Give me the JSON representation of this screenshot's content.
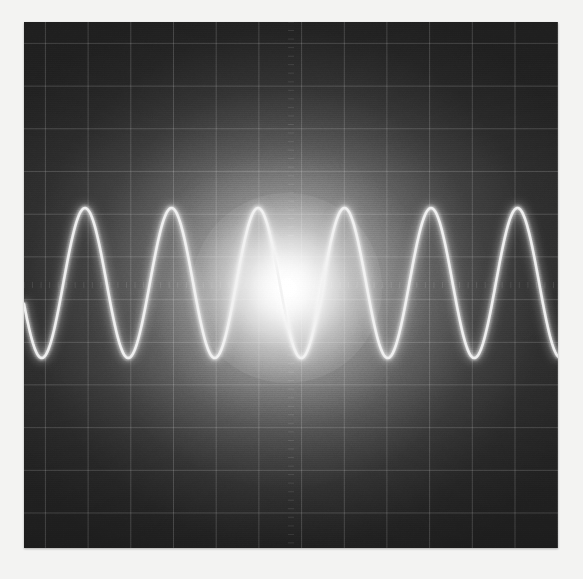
{
  "app": {
    "kind": "oscilloscope-waveform-display",
    "title": "Oscilloscope Waveform Display"
  },
  "canvas": {
    "width": 583,
    "height": 579,
    "bezel_color": "#f3f3f2"
  },
  "screen": {
    "x": 24,
    "y": 22,
    "width": 534,
    "height": 526,
    "background_color": "#2b2b2b",
    "edge_color": "#2a2a2a",
    "center_color": "#ffffff"
  },
  "glow": {
    "label": "phosphor-bloom",
    "center_x": 263,
    "center_y": 266,
    "radius": 360,
    "hotspot_radius": 95,
    "hotspot_color": "#ffffff"
  },
  "grid": {
    "visible": true,
    "spacing_px": 42.7,
    "columns": 12,
    "rows": 12,
    "line_color": "#ffffff",
    "line_opacity": 0.16,
    "line_width": 1,
    "minor_ticks": true
  },
  "chart_data": {
    "type": "line",
    "subtitle": "",
    "xlabel": "",
    "ylabel": "",
    "grid": true,
    "legend": "none",
    "axis_ranges": {
      "x_px": [
        0,
        534
      ],
      "y_px": [
        0,
        526
      ]
    },
    "series": [
      {
        "name": "sine-trace",
        "waveform": "sine",
        "color": "#f2f2f2",
        "line_width": 3,
        "amplitude_px": 75,
        "period_px": 86.5,
        "cycles": 6.2,
        "centerline_y_px": 261,
        "peak_y_px": 186,
        "trough_y_px": 336,
        "first_peak_x_px": 61,
        "phase_deg": 0,
        "x": [
          0,
          21.6,
          43.3,
          64.9,
          86.5,
          108.1,
          129.8,
          151.4,
          173.0,
          194.6,
          216.3,
          237.9,
          259.5,
          281.1,
          302.8,
          324.4,
          346.0,
          367.6,
          389.3,
          410.9,
          432.5,
          454.1,
          475.8,
          497.4,
          519.0,
          534.0
        ],
        "y": [
          261,
          186,
          261,
          336,
          261,
          186,
          261,
          336,
          261,
          186,
          261,
          336,
          261,
          186,
          261,
          336,
          261,
          186,
          261,
          336,
          261,
          186,
          261,
          336,
          261,
          224
        ]
      }
    ]
  },
  "effects": {
    "scanlines": true,
    "vignette": true,
    "noise": true
  }
}
